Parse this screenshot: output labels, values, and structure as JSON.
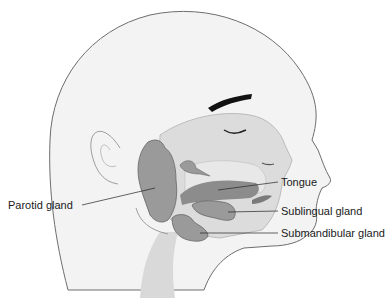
{
  "diagram": {
    "labels": {
      "parotid": "Parotid gland",
      "tongue": "Tongue",
      "sublingual": "Sublingual gland",
      "submandibular": "Submandibular gland"
    },
    "colors": {
      "skin": "#f2f2f2",
      "outline": "#6e6e6e",
      "cavity": "#d6d6d6",
      "gland": "#9a9a9a",
      "tongue": "#8c8c8c",
      "eyebrow": "#111111"
    }
  }
}
